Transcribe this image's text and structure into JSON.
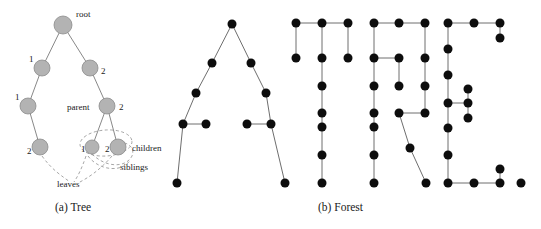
{
  "figure": {
    "background_color": "#ffffff",
    "panels": [
      {
        "id": "a",
        "caption": "(a) Tree"
      },
      {
        "id": "b",
        "caption": "(b) Forest"
      }
    ]
  },
  "captions": {
    "tree": "(a) Tree",
    "forest": "(b) Forest"
  },
  "tree": {
    "node_fill": "#b3b3b3",
    "node_stroke": "#8c8c8c",
    "edge_color": "#7a7a7a",
    "dashed_color": "#8c8c8c",
    "nodes": [
      {
        "id": "root",
        "cx": 63,
        "cy": 25,
        "r": 9
      },
      {
        "id": "l1",
        "cx": 42,
        "cy": 68,
        "r": 8
      },
      {
        "id": "r1",
        "cx": 90,
        "cy": 68,
        "r": 8
      },
      {
        "id": "l2",
        "cx": 28,
        "cy": 106,
        "r": 8
      },
      {
        "id": "r2",
        "cx": 107,
        "cy": 106,
        "r": 8
      },
      {
        "id": "l3",
        "cx": 40,
        "cy": 147,
        "r": 8
      },
      {
        "id": "c1",
        "cx": 92,
        "cy": 147,
        "r": 7
      },
      {
        "id": "c2",
        "cx": 118,
        "cy": 147,
        "r": 8
      }
    ],
    "edges": [
      {
        "from": "root",
        "to": "l1"
      },
      {
        "from": "root",
        "to": "r1"
      },
      {
        "from": "l1",
        "to": "l2"
      },
      {
        "from": "r1",
        "to": "r2"
      },
      {
        "from": "l2",
        "to": "l3"
      },
      {
        "from": "r2",
        "to": "c1"
      },
      {
        "from": "r2",
        "to": "c2"
      }
    ],
    "edge_labels": [
      {
        "text": "1",
        "x": 29,
        "y": 62,
        "for": "l1"
      },
      {
        "text": "2",
        "x": 101,
        "y": 74,
        "for": "r1"
      },
      {
        "text": "1",
        "x": 15,
        "y": 100,
        "for": "l2"
      },
      {
        "text": "2",
        "x": 119,
        "y": 110,
        "for": "r2"
      },
      {
        "text": "2",
        "x": 27,
        "y": 154,
        "for": "l3"
      },
      {
        "text": "1",
        "x": 81,
        "y": 152,
        "for": "c1"
      },
      {
        "text": "2",
        "x": 105,
        "y": 152,
        "for": "c2"
      }
    ],
    "annotations": [
      {
        "text": "root",
        "x": 76,
        "y": 17
      },
      {
        "text": "parent",
        "x": 67,
        "y": 110
      },
      {
        "text": "children",
        "x": 132,
        "y": 151
      },
      {
        "text": "siblings",
        "x": 120,
        "y": 170
      },
      {
        "text": "leaves",
        "x": 57,
        "y": 187
      }
    ]
  },
  "forest": {
    "node_fill": "#0d0d0d",
    "edge_color": "#6e6e6e",
    "word": "ATREE.",
    "node_radius": 4.5,
    "letters": [
      {
        "letter": "A",
        "nodes": [
          [
            232,
            24
          ],
          [
            212,
            63
          ],
          [
            251,
            63
          ],
          [
            196,
            93
          ],
          [
            266,
            93
          ],
          [
            183,
            124
          ],
          [
            206,
            124
          ],
          [
            247,
            124
          ],
          [
            271,
            124
          ],
          [
            177,
            183
          ],
          [
            285,
            183
          ]
        ],
        "edges": [
          [
            [
              232,
              24
            ],
            [
              212,
              63
            ]
          ],
          [
            [
              232,
              24
            ],
            [
              251,
              63
            ]
          ],
          [
            [
              212,
              63
            ],
            [
              196,
              93
            ]
          ],
          [
            [
              251,
              63
            ],
            [
              266,
              93
            ]
          ],
          [
            [
              196,
              93
            ],
            [
              183,
              124
            ]
          ],
          [
            [
              266,
              93
            ],
            [
              271,
              124
            ]
          ],
          [
            [
              183,
              124
            ],
            [
              206,
              124
            ]
          ],
          [
            [
              247,
              124
            ],
            [
              271,
              124
            ]
          ],
          [
            [
              183,
              124
            ],
            [
              177,
              183
            ]
          ],
          [
            [
              271,
              124
            ],
            [
              285,
              183
            ]
          ]
        ]
      },
      {
        "letter": "T",
        "nodes": [
          [
            296,
            23
          ],
          [
            322,
            23
          ],
          [
            348,
            23
          ],
          [
            296,
            58
          ],
          [
            322,
            58
          ],
          [
            348,
            58
          ],
          [
            322,
            86
          ],
          [
            322,
            113
          ],
          [
            322,
            127
          ],
          [
            322,
            155
          ],
          [
            322,
            183
          ]
        ],
        "edges": [
          [
            [
              296,
              23
            ],
            [
              322,
              23
            ]
          ],
          [
            [
              322,
              23
            ],
            [
              348,
              23
            ]
          ],
          [
            [
              296,
              23
            ],
            [
              296,
              58
            ]
          ],
          [
            [
              348,
              23
            ],
            [
              348,
              58
            ]
          ],
          [
            [
              322,
              23
            ],
            [
              322,
              58
            ]
          ],
          [
            [
              322,
              58
            ],
            [
              322,
              86
            ]
          ],
          [
            [
              322,
              86
            ],
            [
              322,
              113
            ]
          ],
          [
            [
              322,
              113
            ],
            [
              322,
              127
            ]
          ],
          [
            [
              322,
              127
            ],
            [
              322,
              155
            ]
          ],
          [
            [
              322,
              155
            ],
            [
              322,
              183
            ]
          ]
        ]
      },
      {
        "letter": "R",
        "nodes": [
          [
            374,
            23
          ],
          [
            399,
            23
          ],
          [
            425,
            23
          ],
          [
            374,
            58
          ],
          [
            399,
            58
          ],
          [
            425,
            58
          ],
          [
            374,
            86
          ],
          [
            399,
            86
          ],
          [
            425,
            86
          ],
          [
            374,
            113
          ],
          [
            399,
            113
          ],
          [
            425,
            113
          ],
          [
            374,
            127
          ],
          [
            410,
            148
          ],
          [
            374,
            155
          ],
          [
            374,
            183
          ],
          [
            426,
            183
          ]
        ],
        "edges": [
          [
            [
              374,
              23
            ],
            [
              399,
              23
            ]
          ],
          [
            [
              399,
              23
            ],
            [
              425,
              23
            ]
          ],
          [
            [
              374,
              23
            ],
            [
              374,
              58
            ]
          ],
          [
            [
              425,
              23
            ],
            [
              425,
              58
            ]
          ],
          [
            [
              374,
              58
            ],
            [
              399,
              58
            ]
          ],
          [
            [
              399,
              58
            ],
            [
              399,
              86
            ]
          ],
          [
            [
              425,
              58
            ],
            [
              425,
              86
            ]
          ],
          [
            [
              425,
              86
            ],
            [
              425,
              113
            ]
          ],
          [
            [
              399,
              113
            ],
            [
              425,
              113
            ]
          ],
          [
            [
              374,
              58
            ],
            [
              374,
              86
            ]
          ],
          [
            [
              374,
              86
            ],
            [
              374,
              113
            ]
          ],
          [
            [
              374,
              113
            ],
            [
              374,
              127
            ]
          ],
          [
            [
              374,
              127
            ],
            [
              374,
              155
            ]
          ],
          [
            [
              374,
              155
            ],
            [
              374,
              183
            ]
          ],
          [
            [
              399,
              113
            ],
            [
              410,
              148
            ]
          ],
          [
            [
              410,
              148
            ],
            [
              426,
              183
            ]
          ]
        ]
      },
      {
        "letter": "E",
        "nodes": [
          [
            448,
            23
          ],
          [
            474,
            23
          ],
          [
            500,
            23
          ],
          [
            500,
            38
          ],
          [
            448,
            49
          ],
          [
            448,
            75
          ],
          [
            468,
            89
          ],
          [
            448,
            103
          ],
          [
            468,
            103
          ],
          [
            468,
            118
          ],
          [
            448,
            128
          ],
          [
            448,
            155
          ],
          [
            448,
            183
          ],
          [
            474,
            183
          ],
          [
            500,
            183
          ],
          [
            500,
            169
          ]
        ],
        "edges": [
          [
            [
              448,
              23
            ],
            [
              474,
              23
            ]
          ],
          [
            [
              474,
              23
            ],
            [
              500,
              23
            ]
          ],
          [
            [
              500,
              23
            ],
            [
              500,
              38
            ]
          ],
          [
            [
              448,
              23
            ],
            [
              448,
              49
            ]
          ],
          [
            [
              448,
              49
            ],
            [
              448,
              75
            ]
          ],
          [
            [
              448,
              75
            ],
            [
              448,
              103
            ]
          ],
          [
            [
              448,
              103
            ],
            [
              468,
              103
            ]
          ],
          [
            [
              468,
              89
            ],
            [
              468,
              103
            ]
          ],
          [
            [
              468,
              103
            ],
            [
              468,
              118
            ]
          ],
          [
            [
              448,
              103
            ],
            [
              448,
              128
            ]
          ],
          [
            [
              448,
              128
            ],
            [
              448,
              155
            ]
          ],
          [
            [
              448,
              155
            ],
            [
              448,
              183
            ]
          ],
          [
            [
              448,
              183
            ],
            [
              474,
              183
            ]
          ],
          [
            [
              474,
              183
            ],
            [
              500,
              183
            ]
          ],
          [
            [
              500,
              183
            ],
            [
              500,
              169
            ]
          ]
        ]
      },
      {
        "letter": ".",
        "nodes": [
          [
            521,
            183
          ]
        ],
        "edges": []
      }
    ]
  }
}
